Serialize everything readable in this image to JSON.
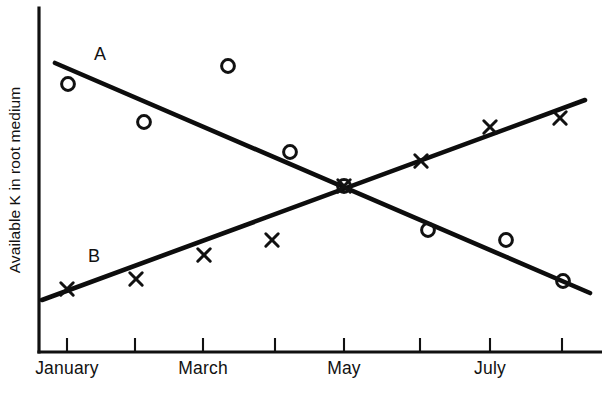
{
  "chart_data": {
    "type": "scatter",
    "title": "",
    "xlabel": "",
    "ylabel": "Available K in root medium",
    "grid": false,
    "legend": "inline-labels",
    "xlim": [
      0,
      9
    ],
    "ylim": [
      0,
      10
    ],
    "x_tick_positions": [
      1,
      2,
      3,
      4,
      5,
      6,
      7,
      8
    ],
    "x_tick_labels": [
      "January",
      "",
      "March",
      "",
      "May",
      "",
      "July",
      ""
    ],
    "x_tick_labels_visible": [
      "January",
      "March",
      "May",
      "July"
    ],
    "series": [
      {
        "name": "A",
        "marker": "circle",
        "label": "A",
        "label_x": 100,
        "label_y": 60,
        "trend": "decreasing",
        "trend_line": {
          "x1": 55,
          "y1": 63,
          "x2": 590,
          "y2": 293
        },
        "points": [
          {
            "x": 68,
            "y": 84
          },
          {
            "x": 144,
            "y": 122
          },
          {
            "x": 228,
            "y": 66
          },
          {
            "x": 290,
            "y": 152
          },
          {
            "x": 344,
            "y": 186
          },
          {
            "x": 428,
            "y": 230
          },
          {
            "x": 506,
            "y": 240
          },
          {
            "x": 563,
            "y": 281
          }
        ]
      },
      {
        "name": "B",
        "marker": "cross",
        "label": "B",
        "label_x": 94,
        "label_y": 262,
        "trend": "increasing",
        "trend_line": {
          "x1": 42,
          "y1": 300,
          "x2": 585,
          "y2": 100
        },
        "points": [
          {
            "x": 67,
            "y": 289
          },
          {
            "x": 136,
            "y": 279
          },
          {
            "x": 204,
            "y": 255
          },
          {
            "x": 272,
            "y": 240
          },
          {
            "x": 344,
            "y": 186
          },
          {
            "x": 421,
            "y": 161
          },
          {
            "x": 490,
            "y": 127
          },
          {
            "x": 560,
            "y": 118
          }
        ]
      }
    ],
    "intersection": {
      "x": 344,
      "y": 186,
      "note": "series A and B cross near May"
    },
    "colors": {
      "ink": "#111111",
      "background": "#ffffff"
    }
  },
  "axes": {
    "y_title": "Available K in root medium",
    "y_axis_x": 39,
    "y_axis_top": 8,
    "y_axis_bottom": 352,
    "x_axis_y": 352,
    "x_axis_left": 39,
    "x_axis_right": 602,
    "tick_pixels": [
      67,
      135,
      203,
      275,
      344,
      420,
      490,
      562
    ],
    "tick_label_entries": [
      {
        "text": "January",
        "x": 67
      },
      {
        "text": "March",
        "x": 203
      },
      {
        "text": "May",
        "x": 344
      },
      {
        "text": "July",
        "x": 490
      }
    ]
  },
  "series_labels": {
    "a": "A",
    "b": "B"
  }
}
